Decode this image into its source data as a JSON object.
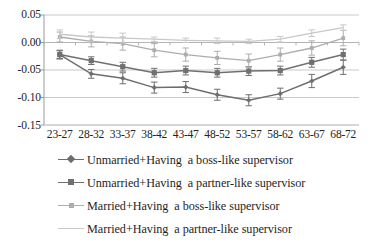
{
  "chart_data": {
    "type": "line",
    "title": "",
    "subtitle": "",
    "xlabel": "",
    "ylabel": "",
    "categories": [
      "23-27",
      "28-32",
      "33-37",
      "38-42",
      "43-47",
      "48-52",
      "53-57",
      "58-62",
      "63-67",
      "68-72"
    ],
    "ylim": [
      -0.15,
      0.05
    ],
    "yticks": [
      "0.05",
      "0.00",
      "-0.05",
      "-0.10",
      "-0.15"
    ],
    "ytick_values": [
      0.05,
      0.0,
      -0.05,
      -0.1,
      -0.15
    ],
    "grid": true,
    "grid_axis": "y",
    "legend_position": "bottom",
    "error_bars": true,
    "series": [
      {
        "name": "Unmarried+Having  a boss-like supervisor",
        "color": "#6e6e6e",
        "marker": "diamond",
        "values": [
          -0.022,
          -0.057,
          -0.065,
          -0.082,
          -0.081,
          -0.095,
          -0.105,
          -0.093,
          -0.07,
          -0.045
        ],
        "errors": [
          0.008,
          0.008,
          0.01,
          0.01,
          0.01,
          0.01,
          0.01,
          0.01,
          0.012,
          0.013
        ]
      },
      {
        "name": "Unmarried+Having  a partner-like supervisor",
        "color": "#707070",
        "marker": "square",
        "values": [
          -0.022,
          -0.033,
          -0.044,
          -0.055,
          -0.051,
          -0.055,
          -0.052,
          -0.051,
          -0.036,
          -0.022
        ],
        "errors": [
          0.007,
          0.007,
          0.008,
          0.008,
          0.008,
          0.008,
          0.008,
          0.008,
          0.009,
          0.01
        ]
      },
      {
        "name": "Married+Having  a boss-like supervisor",
        "color": "#adadad",
        "marker": "square-small",
        "values": [
          0.01,
          0.002,
          -0.002,
          -0.014,
          -0.022,
          -0.028,
          -0.033,
          -0.022,
          -0.01,
          0.008
        ],
        "errors": [
          0.009,
          0.01,
          0.012,
          0.012,
          0.012,
          0.012,
          0.012,
          0.012,
          0.013,
          0.014
        ]
      },
      {
        "name": "Married+Having  a partner-like supervisor",
        "color": "#c8c8c8",
        "marker": "none",
        "values": [
          0.015,
          0.01,
          0.008,
          0.006,
          0.004,
          0.003,
          0.002,
          0.006,
          0.017,
          0.027
        ],
        "errors": [
          0.008,
          0.009,
          0.009,
          0.004,
          0.004,
          0.005,
          0.004,
          0.005,
          0.006,
          0.005
        ]
      }
    ]
  },
  "axis": {
    "ytick_labels": [
      "0.05",
      "0.00",
      "-0.05",
      "-0.10",
      "-0.15"
    ],
    "xtick_labels": [
      "23-27",
      "28-32",
      "33-37",
      "38-42",
      "43-47",
      "48-52",
      "53-57",
      "58-62",
      "63-67",
      "68-72"
    ]
  },
  "legend": {
    "items": [
      {
        "label": "Unmarried+Having  a boss-like supervisor",
        "color": "#6e6e6e",
        "marker": "diamond"
      },
      {
        "label": "Unmarried+Having  a partner-like supervisor",
        "color": "#707070",
        "marker": "square"
      },
      {
        "label": "Married+Having  a boss-like supervisor",
        "color": "#adadad",
        "marker": "square-small"
      },
      {
        "label": "Married+Having  a partner-like supervisor",
        "color": "#c8c8c8",
        "marker": "none"
      }
    ]
  },
  "colors": {
    "grid": "#c9c9c9",
    "axis": "#9a9a9a",
    "text": "#232323",
    "background": "#ffffff"
  }
}
